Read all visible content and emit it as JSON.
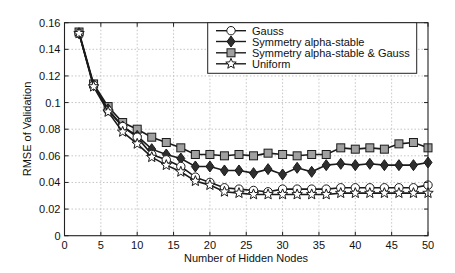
{
  "chart_data": {
    "type": "line",
    "title": "",
    "xlabel": "Number of Hidden Nodes",
    "ylabel": "RMSE of Validation",
    "xlim": [
      0,
      50
    ],
    "ylim": [
      0,
      0.16
    ],
    "grid": true,
    "legend_position": "upper right (inside)",
    "x_ticks": [
      0,
      5,
      10,
      15,
      20,
      25,
      30,
      35,
      40,
      45,
      50
    ],
    "x_tick_labels": [
      "0",
      "5",
      "10",
      "15",
      "20",
      "25",
      "30",
      "35",
      "40",
      "45",
      "50"
    ],
    "y_ticks": [
      0,
      0.02,
      0.04,
      0.06,
      0.08,
      0.1,
      0.12,
      0.14,
      0.16
    ],
    "y_tick_labels": [
      "0",
      "0.02",
      "0.04",
      "0.06",
      "0.08",
      "0.1",
      "0.12",
      "0.14",
      "0.16"
    ],
    "x": [
      2,
      4,
      6,
      8,
      10,
      12,
      14,
      16,
      18,
      20,
      22,
      24,
      26,
      28,
      30,
      32,
      34,
      36,
      38,
      40,
      42,
      44,
      46,
      48,
      50
    ],
    "series": [
      {
        "name": "Gauss",
        "marker": "circle",
        "marker_fill": "#ffffff",
        "values": [
          0.152,
          0.113,
          0.094,
          0.082,
          0.074,
          0.061,
          0.057,
          0.052,
          0.044,
          0.04,
          0.036,
          0.035,
          0.034,
          0.033,
          0.035,
          0.035,
          0.035,
          0.035,
          0.036,
          0.036,
          0.036,
          0.036,
          0.036,
          0.036,
          0.038
        ]
      },
      {
        "name": "Symmetry alpha-stable",
        "marker": "diamond",
        "marker_fill": "#2e2e2e",
        "values": [
          0.152,
          0.113,
          0.095,
          0.082,
          0.075,
          0.065,
          0.061,
          0.058,
          0.052,
          0.052,
          0.049,
          0.049,
          0.047,
          0.05,
          0.046,
          0.051,
          0.048,
          0.053,
          0.054,
          0.053,
          0.054,
          0.053,
          0.053,
          0.053,
          0.055
        ]
      },
      {
        "name": "Symmetry alpha-stable & Gauss",
        "marker": "square",
        "marker_fill": "#a0a0a0",
        "values": [
          0.153,
          0.114,
          0.097,
          0.085,
          0.08,
          0.074,
          0.07,
          0.066,
          0.061,
          0.061,
          0.06,
          0.061,
          0.06,
          0.062,
          0.061,
          0.06,
          0.061,
          0.061,
          0.066,
          0.065,
          0.066,
          0.065,
          0.069,
          0.07,
          0.066
        ]
      },
      {
        "name": "Uniform",
        "marker": "star",
        "marker_fill": "#ffffff",
        "values": [
          0.152,
          0.112,
          0.093,
          0.078,
          0.069,
          0.059,
          0.053,
          0.048,
          0.041,
          0.038,
          0.033,
          0.032,
          0.031,
          0.031,
          0.031,
          0.031,
          0.031,
          0.031,
          0.032,
          0.032,
          0.032,
          0.032,
          0.032,
          0.032,
          0.032
        ]
      }
    ]
  }
}
